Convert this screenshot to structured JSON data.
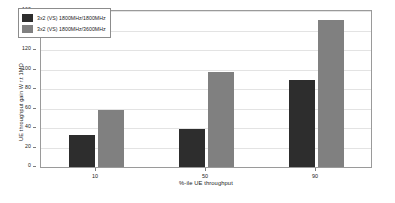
{
  "chart_data": {
    "type": "bar",
    "title": "",
    "xlabel": "%-ile UE throughput",
    "ylabel": "UE throughput gain W r.t 1MO",
    "categories": [
      "10",
      "50",
      "90"
    ],
    "series": [
      {
        "name": "3x2 (VS) 1800MHz/1800MHz",
        "color": "#2d2d2d",
        "values": [
          33,
          39,
          89
        ]
      },
      {
        "name": "3x2 (VS) 1800MHz/3600MHz",
        "color": "#808080",
        "values": [
          58,
          97,
          151
        ]
      }
    ],
    "ylim": [
      0,
      160
    ],
    "yticks": [
      0,
      20,
      40,
      60,
      80,
      100,
      120,
      140,
      160
    ],
    "ytick_labels": [
      "0",
      "20",
      "40",
      "60",
      "80",
      "100",
      "120",
      "140",
      "160"
    ],
    "xtick_labels": [
      "10",
      "50",
      "90"
    ],
    "grid": true,
    "legend_position": "upper-left",
    "background_color": "#ffffff",
    "axis_color": "#9a9a9a",
    "grid_color": "#e3e3e3"
  }
}
